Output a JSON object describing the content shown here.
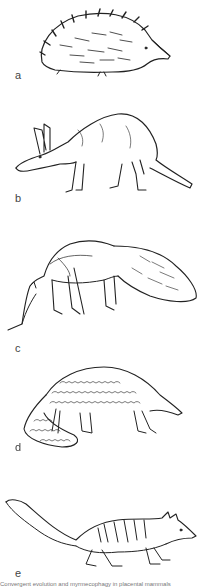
{
  "figure": {
    "panels": [
      {
        "label": "a",
        "animal": "echidna-illustration"
      },
      {
        "label": "b",
        "animal": "aardvark-illustration"
      },
      {
        "label": "c",
        "animal": "giant-anteater-illustration"
      },
      {
        "label": "d",
        "animal": "pangolin-illustration"
      },
      {
        "label": "e",
        "animal": "numbat-illustration"
      }
    ],
    "caption": "Convergent evolution and myrmecophagy in placental mammals"
  }
}
